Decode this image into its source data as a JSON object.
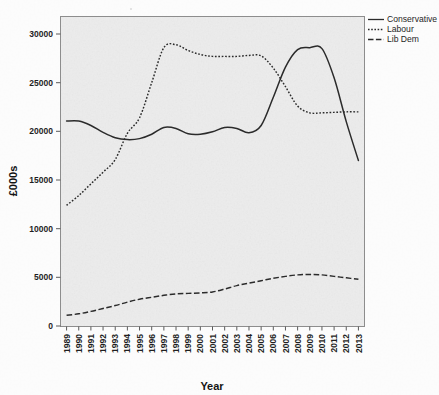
{
  "chart_data": {
    "type": "line",
    "title": "",
    "xlabel": "Year",
    "ylabel": "£000s",
    "ylim": [
      0,
      31500
    ],
    "yticks": [
      0,
      5000,
      10000,
      15000,
      20000,
      25000,
      30000
    ],
    "ytick_labels": [
      "0",
      "5000",
      "10000",
      "15000",
      "20000",
      "25000",
      "30000"
    ],
    "grid": false,
    "legend_position": "top-right",
    "plot_background": "#ebebeb",
    "categories": [
      "1989",
      "1990",
      "1991",
      "1992",
      "1993",
      "1994",
      "1995",
      "1996",
      "1997",
      "1998",
      "1999",
      "2000",
      "2001",
      "2002",
      "2003",
      "2004",
      "2005",
      "2006",
      "2007",
      "2008",
      "2009",
      "2010",
      "2011",
      "2012",
      "2013"
    ],
    "series": [
      {
        "name": "Conservative",
        "style": "solid",
        "color": "#2b2b2b",
        "values": [
          21050,
          21050,
          20600,
          19900,
          19350,
          19150,
          19250,
          19700,
          20400,
          20300,
          19750,
          19700,
          19950,
          20400,
          20300,
          19850,
          20600,
          23500,
          26600,
          28400,
          28600,
          28500,
          25500,
          21000,
          17000
        ]
      },
      {
        "name": "Labour",
        "style": "dotted",
        "color": "#2b2b2b",
        "values": [
          12400,
          13400,
          14600,
          15800,
          17100,
          19800,
          21400,
          25000,
          28600,
          28900,
          28300,
          27900,
          27700,
          27700,
          27700,
          27800,
          27750,
          26500,
          24600,
          22600,
          21900,
          21900,
          21950,
          22000,
          22000
        ]
      },
      {
        "name": "Lib Dem",
        "style": "dashed",
        "color": "#2b2b2b",
        "values": [
          1100,
          1250,
          1500,
          1800,
          2100,
          2450,
          2750,
          2950,
          3150,
          3300,
          3350,
          3400,
          3500,
          3800,
          4150,
          4400,
          4650,
          4900,
          5100,
          5250,
          5300,
          5250,
          5100,
          4950,
          4800
        ]
      }
    ]
  },
  "legend": {
    "entries": [
      {
        "label": "Conservative",
        "style": "solid"
      },
      {
        "label": "Labour",
        "style": "dotted"
      },
      {
        "label": "Lib Dem",
        "style": "dashed"
      }
    ]
  },
  "axes": {
    "x_title": "Year",
    "y_title": "£000s"
  }
}
